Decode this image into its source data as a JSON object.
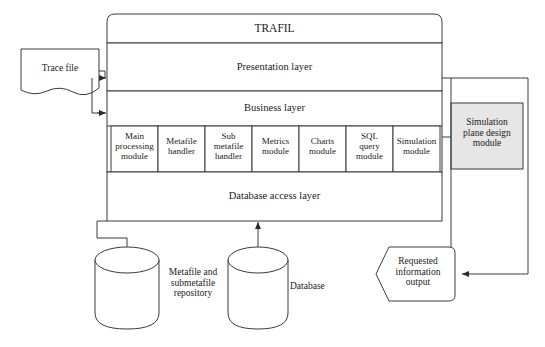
{
  "diagram": {
    "title_box": {
      "label": "TRAFIL"
    },
    "layers": [
      {
        "name": "presentation-layer",
        "label": "Presentation layer"
      },
      {
        "name": "business-layer",
        "label": "Business layer"
      },
      {
        "name": "database-access-layer",
        "label": "Database access layer"
      }
    ],
    "modules": [
      {
        "name": "main-processing-module",
        "label": "Main\nprocessing\nmodule"
      },
      {
        "name": "metafile-handler-module",
        "label": "Metafile\nhandler"
      },
      {
        "name": "sub-metafile-handler-module",
        "label": "Sub\nmetafile\nhandler"
      },
      {
        "name": "metrics-module",
        "label": "Metrics\nmodule"
      },
      {
        "name": "charts-module",
        "label": "Charts\nmodule"
      },
      {
        "name": "sql-query-module",
        "label": "SQL\nquery\nmodule"
      },
      {
        "name": "simulation-module",
        "label": "Simulation\nmodule"
      }
    ],
    "external": {
      "trace_file": {
        "label": "Trace file"
      },
      "simulation_plane_design_module": {
        "label": "Simulation\nplane design\nmodule"
      },
      "requested_information_output": {
        "label": "Requested\ninformation\noutput"
      }
    },
    "datastores": [
      {
        "name": "metafile-repository",
        "label": "Metafile and\nsubmetafile\nrepository"
      },
      {
        "name": "database",
        "label": "Database"
      }
    ],
    "colors": {
      "stroke": "#3a3a3a",
      "text": "#1a1a1a",
      "fill_white": "#ffffff",
      "fill_grey": "#e6e6e6",
      "background": "#ffffff"
    }
  }
}
